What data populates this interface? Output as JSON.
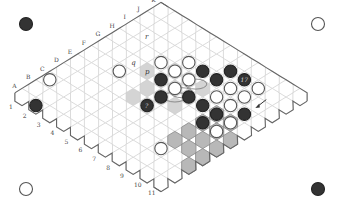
{
  "diagram": {
    "type": "hex-board",
    "size": 11,
    "column_labels": [
      "A",
      "B",
      "C",
      "D",
      "E",
      "F",
      "G",
      "H",
      "I",
      "J",
      "K"
    ],
    "row_labels": [
      "1",
      "2",
      "3",
      "4",
      "5",
      "6",
      "7",
      "8",
      "9",
      "10",
      "11"
    ],
    "colors": {
      "black_stone": "#333333",
      "white_stone": "#ffffff",
      "cell_stroke": "#cccccc",
      "edge_stroke": "#666666",
      "shade_light": "#d4d4d4",
      "shade_dark": "#b8b8b8"
    },
    "corner_stones": [
      {
        "position": "top-left",
        "color": "black"
      },
      {
        "position": "top-right",
        "color": "white"
      },
      {
        "position": "bottom-left",
        "color": "white"
      },
      {
        "position": "bottom-right",
        "color": "black"
      }
    ],
    "annotations": [
      {
        "text": "r",
        "cell": "r-mark"
      },
      {
        "text": "q",
        "cell": "q-mark"
      },
      {
        "text": "p",
        "cell": "p-mark"
      },
      {
        "text": "?",
        "cell": "question-stone"
      },
      {
        "text": "17",
        "cell": "numbered-stone"
      }
    ]
  }
}
